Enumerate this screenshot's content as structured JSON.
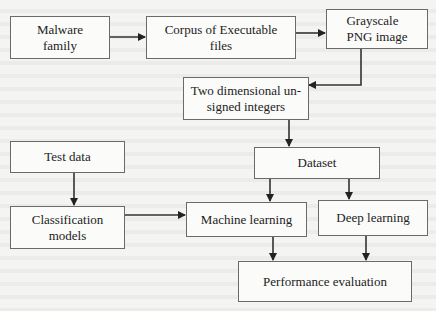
{
  "diagram": {
    "nodes": {
      "malware_family": {
        "line1": "Malware",
        "line2": "family"
      },
      "corpus": {
        "line1": "Corpus of Executable",
        "line2": "files"
      },
      "grayscale": {
        "line1": "Grayscale",
        "line2": "PNG image"
      },
      "two_dim": {
        "line1": "Two dimensional un-",
        "line2": "signed integers"
      },
      "dataset": {
        "line1": "Dataset"
      },
      "test_data": {
        "line1": "Test data"
      },
      "classification": {
        "line1": "Classification",
        "line2": "models"
      },
      "machine_learning": {
        "line1": "Machine learning"
      },
      "deep_learning": {
        "line1": "Deep learning"
      },
      "performance": {
        "line1": "Performance evaluation"
      }
    },
    "edges": [
      {
        "from": "Malware family",
        "to": "Corpus of Executable files"
      },
      {
        "from": "Corpus of Executable files",
        "to": "Grayscale PNG image"
      },
      {
        "from": "Grayscale PNG image",
        "to": "Two dimensional un-signed integers"
      },
      {
        "from": "Two dimensional un-signed integers",
        "to": "Dataset"
      },
      {
        "from": "Dataset",
        "to": "Machine learning"
      },
      {
        "from": "Dataset",
        "to": "Deep learning"
      },
      {
        "from": "Test data",
        "to": "Classification models"
      },
      {
        "from": "Classification models",
        "to": "Machine learning"
      },
      {
        "from": "Machine learning",
        "to": "Performance evaluation"
      },
      {
        "from": "Deep learning",
        "to": "Performance evaluation"
      }
    ],
    "colors": {
      "stroke": "#333333",
      "box_border": "#6a6a6a",
      "box_fill": "#fbfbfa"
    }
  }
}
